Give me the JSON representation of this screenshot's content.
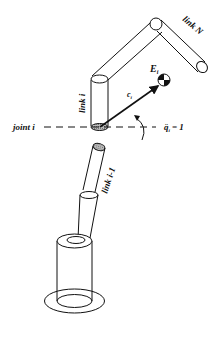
{
  "diagram": {
    "type": "robot-arm-schematic",
    "labels": {
      "link_n": "link N",
      "link_i": "link i",
      "link_i_minus_1": "link i-1",
      "joint_i": "joint i",
      "end_effector": "E",
      "end_effector_sub": "i",
      "vector": "c",
      "vector_sub": "i",
      "accel_eq": "q̈",
      "accel_sub": "i",
      "accel_rhs": "= 1"
    },
    "colors": {
      "stroke": "#111111",
      "background": "#ffffff",
      "hatch": "#9a9a9a"
    }
  }
}
